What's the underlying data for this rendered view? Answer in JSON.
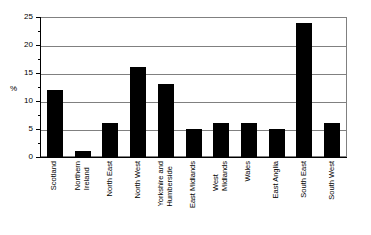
{
  "chart_data": {
    "type": "bar",
    "title": "",
    "xlabel": "",
    "ylabel": "%",
    "ylim": [
      0,
      25
    ],
    "yticks": [
      0,
      5,
      10,
      15,
      20,
      25
    ],
    "grid": true,
    "legend": "none",
    "orientation": "vertical",
    "bar_color": "#000000",
    "categories": [
      "Scotland",
      "Northern\nIreland",
      "North East",
      "North West",
      "Yorkshire and\nHumberside",
      "East Midlands",
      "West\nMidlands",
      "Wales",
      "East Anglia",
      "South East",
      "South West"
    ],
    "values": [
      12,
      1,
      6,
      16,
      13,
      5,
      6,
      6,
      5,
      24,
      6
    ]
  },
  "axis": {
    "y_title": "%",
    "tick_labels": [
      "0",
      "5",
      "10",
      "15",
      "20",
      "25"
    ]
  }
}
